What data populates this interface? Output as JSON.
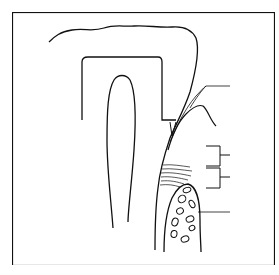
{
  "figure": {
    "type": "tooth-periodontium-cross-section",
    "stroke_color": "#111111",
    "background": "#ffffff",
    "labels": [
      {
        "id": "gingiva",
        "text": ""
      },
      {
        "id": "fiber-group-upper",
        "text": ""
      },
      {
        "id": "fiber-group-lower",
        "text": ""
      },
      {
        "id": "alveolar-bone",
        "text": ""
      }
    ],
    "caption": ""
  }
}
